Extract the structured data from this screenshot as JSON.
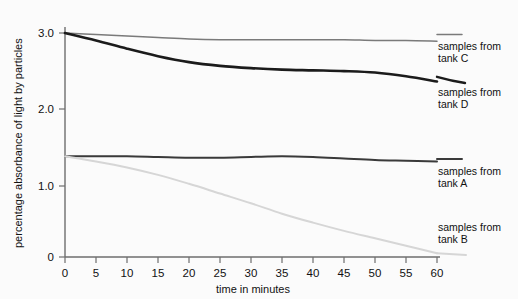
{
  "chart_data": {
    "type": "line",
    "title": "",
    "xlabel": "time in minutes",
    "ylabel": "percentage absorbance of light by particles",
    "xlim": [
      0,
      60
    ],
    "ylim": [
      0,
      3.0
    ],
    "grid": false,
    "legend_position": "right-inline-labels",
    "xticks": [
      "0",
      "5",
      "10",
      "15",
      "20",
      "25",
      "30",
      "35",
      "40",
      "45",
      "50",
      "55",
      "60"
    ],
    "xtick_values": [
      0,
      5,
      10,
      15,
      20,
      25,
      30,
      35,
      40,
      45,
      50,
      55,
      60
    ],
    "yticks": [
      "0",
      "1.0",
      "2.0",
      "3.0"
    ],
    "ytick_values": [
      0,
      1.0,
      2.0,
      3.0
    ],
    "x": [
      0,
      5,
      10,
      15,
      20,
      25,
      30,
      35,
      40,
      45,
      50,
      55,
      60
    ],
    "series": [
      {
        "name": "samples from tank C",
        "label_line1": "samples from",
        "label_line2": "tank C",
        "color": "#7a7a7a",
        "width": 1.5,
        "values": [
          3.0,
          2.98,
          2.96,
          2.94,
          2.92,
          2.91,
          2.91,
          2.91,
          2.91,
          2.91,
          2.9,
          2.9,
          2.89
        ]
      },
      {
        "name": "samples from tank D",
        "label_line1": "samples from",
        "label_line2": "tank D",
        "color": "#1b1b1b",
        "width": 2.6,
        "values": [
          3.0,
          2.9,
          2.79,
          2.69,
          2.61,
          2.56,
          2.53,
          2.51,
          2.5,
          2.49,
          2.47,
          2.42,
          2.35
        ]
      },
      {
        "name": "samples from tank A",
        "label_line1": "samples from",
        "label_line2": "tank A",
        "color": "#3a3a3a",
        "width": 2.0,
        "values": [
          1.35,
          1.35,
          1.35,
          1.34,
          1.33,
          1.33,
          1.34,
          1.35,
          1.34,
          1.32,
          1.3,
          1.29,
          1.28
        ]
      },
      {
        "name": "samples from tank B",
        "label_line1": "samples from",
        "label_line2": "tank B",
        "color": "#d6d6d6",
        "width": 2.0,
        "values": [
          1.35,
          1.28,
          1.2,
          1.1,
          0.98,
          0.85,
          0.72,
          0.58,
          0.46,
          0.35,
          0.25,
          0.15,
          0.05
        ]
      }
    ]
  },
  "labels": {
    "tank_c_1": "samples from",
    "tank_c_2": "tank C",
    "tank_d_1": "samples from",
    "tank_d_2": "tank D",
    "tank_a_1": "samples from",
    "tank_a_2": "tank A",
    "tank_b_1": "samples from",
    "tank_b_2": "tank B"
  },
  "axis": {
    "x_title": "time in minutes",
    "y_title": "percentage absorbance of light by particles",
    "y0": "0",
    "y1": "1.0",
    "y2": "2.0",
    "y3": "3.0",
    "x0": "0",
    "x5": "5",
    "x10": "10",
    "x15": "15",
    "x20": "20",
    "x25": "25",
    "x30": "30",
    "x35": "35",
    "x40": "40",
    "x45": "45",
    "x50": "50",
    "x55": "55",
    "x60": "60"
  }
}
